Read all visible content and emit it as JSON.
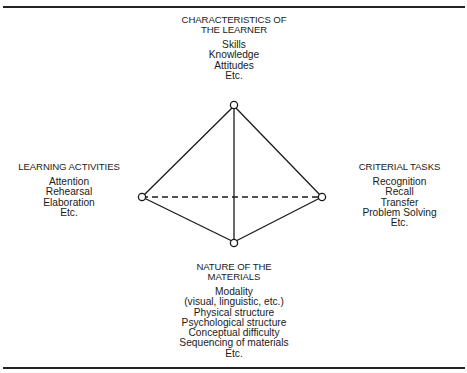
{
  "diagram": {
    "type": "tetrahedral-model",
    "nodes": {
      "top": {
        "heading": [
          "CHARACTERISTICS OF",
          "THE LEARNER"
        ],
        "items": [
          "Skills",
          "Knowledge",
          "Attitudes",
          "Etc."
        ]
      },
      "left": {
        "heading": [
          "LEARNING ACTIVITIES"
        ],
        "items": [
          "Attention",
          "Rehearsal",
          "Elaboration",
          "Etc."
        ]
      },
      "right": {
        "heading": [
          "CRITERIAL TASKS"
        ],
        "items": [
          "Recognition",
          "Recall",
          "Transfer",
          "Problem Solving",
          "Etc."
        ]
      },
      "bottom": {
        "heading": [
          "NATURE OF THE",
          "MATERIALS"
        ],
        "items": [
          "Modality",
          "(visual, linguistic, etc.)",
          "Physical structure",
          "Psychological structure",
          "Conceptual difficulty",
          "Sequencing of materials",
          "Etc."
        ]
      }
    },
    "edges": [
      {
        "from": "top",
        "to": "left",
        "style": "solid"
      },
      {
        "from": "top",
        "to": "right",
        "style": "solid"
      },
      {
        "from": "top",
        "to": "bottom",
        "style": "solid"
      },
      {
        "from": "left",
        "to": "bottom",
        "style": "solid"
      },
      {
        "from": "right",
        "to": "bottom",
        "style": "solid"
      },
      {
        "from": "left",
        "to": "right",
        "style": "dashed"
      }
    ],
    "colors": {
      "line": "#1a1a1a",
      "background": "#ffffff"
    }
  }
}
